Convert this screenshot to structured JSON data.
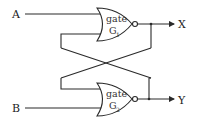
{
  "diagram": {
    "type": "cross-coupled NOR latch",
    "inputs": [
      {
        "label": "A"
      },
      {
        "label": "B"
      }
    ],
    "gates": [
      {
        "word": "gate",
        "name": "G",
        "sub": "1"
      },
      {
        "word": "gate",
        "name": "G",
        "sub": "2"
      }
    ],
    "outputs": [
      {
        "label": "X"
      },
      {
        "label": "Y"
      }
    ],
    "colors": {
      "line": "#2a2a2a",
      "background": "#ffffff"
    }
  }
}
